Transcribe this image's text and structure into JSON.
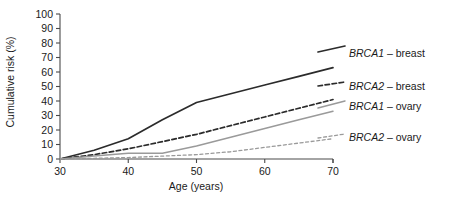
{
  "chart_data": {
    "type": "line",
    "title": "",
    "xlabel": "Age (years)",
    "ylabel": "Cumulative risk (%)",
    "xlim": [
      30,
      70
    ],
    "ylim": [
      0,
      100
    ],
    "xticks": [
      30,
      40,
      50,
      60,
      70
    ],
    "yticks": [
      0,
      10,
      20,
      30,
      40,
      50,
      60,
      70,
      80,
      90,
      100
    ],
    "grid": false,
    "legend_position": "right",
    "x": [
      30,
      35,
      40,
      45,
      50,
      55,
      60,
      65,
      70
    ],
    "series": [
      {
        "name": "BRCA1 – breast",
        "gene": "BRCA1",
        "cancer": "breast",
        "color": "#2b2b2b",
        "style": "solid",
        "width": 1.7,
        "values": [
          0,
          6,
          14,
          27,
          39,
          45,
          51,
          57,
          63
        ]
      },
      {
        "name": "BRCA2 – breast",
        "gene": "BRCA2",
        "cancer": "breast",
        "color": "#2b2b2b",
        "style": "dashed",
        "width": 1.7,
        "values": [
          0,
          3,
          7,
          12,
          17,
          23,
          29,
          35,
          41
        ]
      },
      {
        "name": "BRCA1 – ovary",
        "gene": "BRCA1",
        "cancer": "ovary",
        "color": "#9a9a9a",
        "style": "solid",
        "width": 1.5,
        "values": [
          0,
          2,
          4,
          4,
          9,
          15,
          21,
          27,
          33
        ]
      },
      {
        "name": "BRCA2 – ovary",
        "gene": "BRCA2",
        "cancer": "ovary",
        "color": "#9a9a9a",
        "style": "dashed",
        "width": 1.3,
        "values": [
          0,
          0.5,
          1,
          2,
          3,
          5,
          8,
          11,
          14
        ]
      }
    ]
  },
  "legend": {
    "entries": [
      {
        "gene": "BRCA1",
        "sep": "–",
        "cancer": "breast"
      },
      {
        "gene": "BRCA2",
        "sep": "–",
        "cancer": "breast"
      },
      {
        "gene": "BRCA1",
        "sep": "–",
        "cancer": "ovary"
      },
      {
        "gene": "BRCA2",
        "sep": "–",
        "cancer": "ovary"
      }
    ]
  },
  "axes": {
    "ylabel": "Cumulative risk (%)",
    "xlabel": "Age (years)",
    "ytick_labels": [
      "0",
      "10",
      "20",
      "30",
      "40",
      "50",
      "60",
      "70",
      "80",
      "90",
      "100"
    ],
    "xtick_labels": [
      "30",
      "40",
      "50",
      "60",
      "70"
    ]
  },
  "colors": {
    "black_series": "#2b2b2b",
    "gray_series": "#9a9a9a",
    "axis": "#4a4a4a",
    "text": "#1a1a1a",
    "background": "#ffffff"
  }
}
